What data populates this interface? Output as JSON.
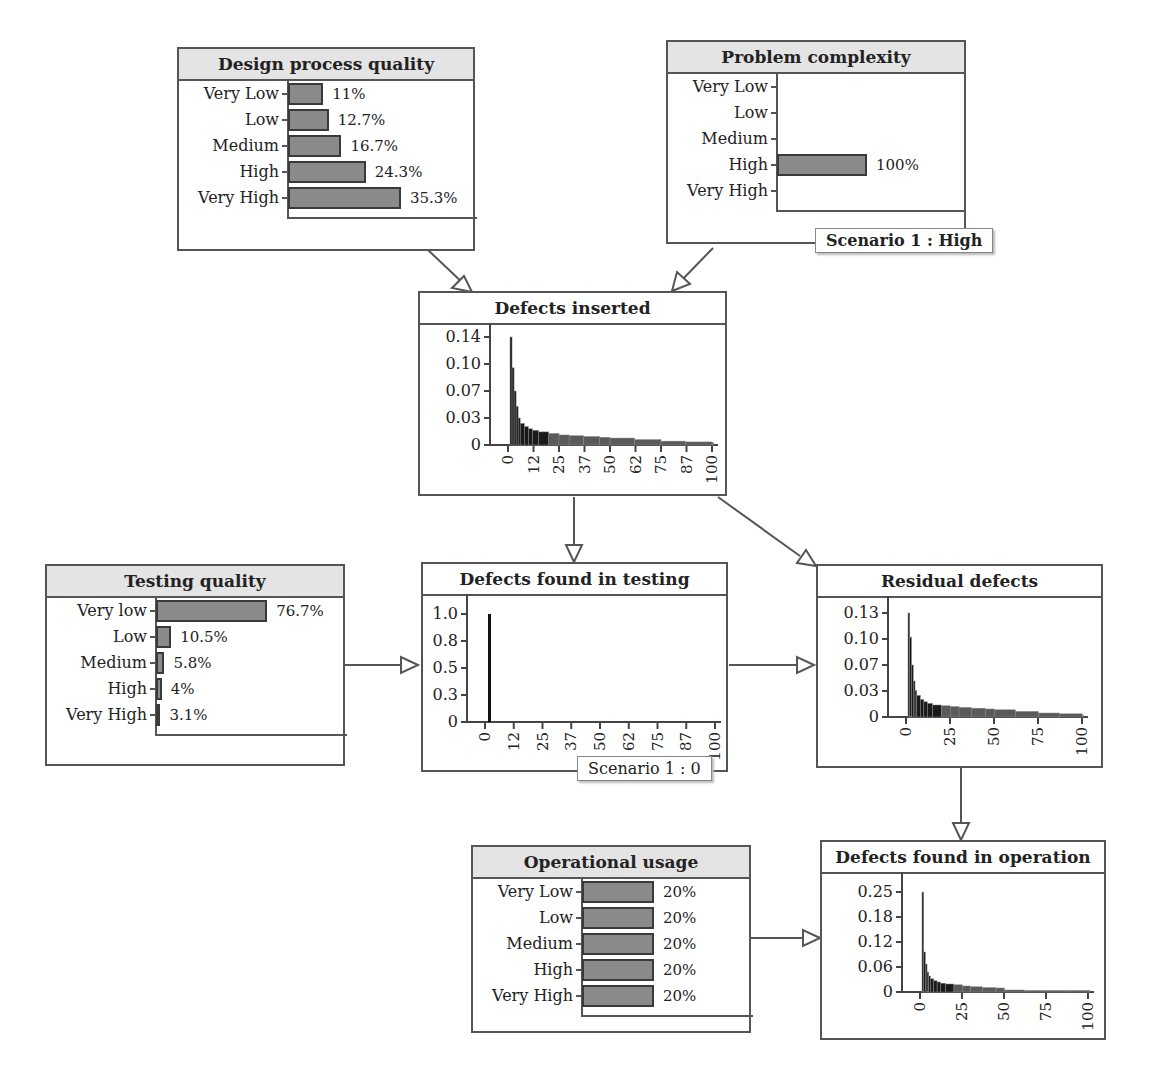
{
  "nodes": {
    "design_process_quality": {
      "title": "Design process quality",
      "states": [
        {
          "label": "Very Low",
          "value": 11,
          "text": "11%"
        },
        {
          "label": "Low",
          "value": 12.7,
          "text": "12.7%"
        },
        {
          "label": "Medium",
          "value": 16.7,
          "text": "16.7%"
        },
        {
          "label": "High",
          "value": 24.3,
          "text": "24.3%"
        },
        {
          "label": "Very High",
          "value": 35.3,
          "text": "35.3%"
        }
      ]
    },
    "problem_complexity": {
      "title": "Problem complexity",
      "states": [
        {
          "label": "Very Low",
          "value": 0,
          "text": ""
        },
        {
          "label": "Low",
          "value": 0,
          "text": ""
        },
        {
          "label": "Medium",
          "value": 0,
          "text": ""
        },
        {
          "label": "High",
          "value": 100,
          "text": "100%"
        },
        {
          "label": "Very High",
          "value": 0,
          "text": ""
        }
      ],
      "scenario": "Scenario 1 : High"
    },
    "defects_inserted": {
      "title": "Defects inserted",
      "yticks": [
        "0.14",
        "0.10",
        "0.07",
        "0.03",
        "0"
      ],
      "xticks": [
        "0",
        "12",
        "25",
        "37",
        "50",
        "62",
        "75",
        "87",
        "100"
      ]
    },
    "testing_quality": {
      "title": "Testing quality",
      "states": [
        {
          "label": "Very low",
          "value": 76.7,
          "text": "76.7%"
        },
        {
          "label": "Low",
          "value": 10.5,
          "text": "10.5%"
        },
        {
          "label": "Medium",
          "value": 5.8,
          "text": "5.8%"
        },
        {
          "label": "High",
          "value": 4,
          "text": "4%"
        },
        {
          "label": "Very High",
          "value": 3.1,
          "text": "3.1%"
        }
      ]
    },
    "defects_found_in_testing": {
      "title": "Defects found in testing",
      "yticks": [
        "1.0",
        "0.8",
        "0.5",
        "0.3",
        "0"
      ],
      "xticks": [
        "0",
        "12",
        "25",
        "37",
        "50",
        "62",
        "75",
        "87",
        "100"
      ],
      "scenario": "Scenario 1 : 0"
    },
    "residual_defects": {
      "title": "Residual defects",
      "yticks": [
        "0.13",
        "0.10",
        "0.07",
        "0.03",
        "0"
      ],
      "xticks": [
        "0",
        "25",
        "50",
        "75",
        "100"
      ]
    },
    "operational_usage": {
      "title": "Operational usage",
      "states": [
        {
          "label": "Very Low",
          "value": 20,
          "text": "20%"
        },
        {
          "label": "Low",
          "value": 20,
          "text": "20%"
        },
        {
          "label": "Medium",
          "value": 20,
          "text": "20%"
        },
        {
          "label": "High",
          "value": 20,
          "text": "20%"
        },
        {
          "label": "Very High",
          "value": 20,
          "text": "20%"
        }
      ]
    },
    "defects_found_in_operation": {
      "title": "Defects found in operation",
      "yticks": [
        "0.25",
        "0.18",
        "0.12",
        "0.06",
        "0"
      ],
      "xticks": [
        "0",
        "25",
        "50",
        "75",
        "100"
      ]
    }
  },
  "chart_data": [
    {
      "type": "bar",
      "title": "Design process quality",
      "categories": [
        "Very Low",
        "Low",
        "Medium",
        "High",
        "Very High"
      ],
      "values": [
        11,
        12.7,
        16.7,
        24.3,
        35.3
      ],
      "unit": "%"
    },
    {
      "type": "bar",
      "title": "Problem complexity",
      "categories": [
        "Very Low",
        "Low",
        "Medium",
        "High",
        "Very High"
      ],
      "values": [
        0,
        0,
        0,
        100,
        0
      ],
      "unit": "%",
      "annotation": "Scenario 1 : High"
    },
    {
      "type": "bar",
      "title": "Defects inserted",
      "xlabel": "",
      "ylabel": "",
      "ylim": [
        0,
        0.14
      ],
      "yticks": [
        0.14,
        0.1,
        0.07,
        0.03,
        0
      ],
      "xticks": [
        0,
        12,
        25,
        37,
        50,
        62,
        75,
        87,
        100
      ],
      "x": [
        1,
        2,
        3,
        4,
        5,
        6,
        8,
        10,
        12,
        15,
        20,
        25,
        30,
        37,
        45,
        50,
        62,
        75,
        87,
        100
      ],
      "values": [
        0.14,
        0.1,
        0.07,
        0.05,
        0.035,
        0.028,
        0.024,
        0.021,
        0.019,
        0.017,
        0.015,
        0.013,
        0.012,
        0.011,
        0.01,
        0.009,
        0.007,
        0.005,
        0.004,
        0.003
      ]
    },
    {
      "type": "bar",
      "title": "Testing quality",
      "categories": [
        "Very low",
        "Low",
        "Medium",
        "High",
        "Very High"
      ],
      "values": [
        76.7,
        10.5,
        5.8,
        4,
        3.1
      ],
      "unit": "%"
    },
    {
      "type": "bar",
      "title": "Defects found in testing",
      "ylim": [
        0,
        1.0
      ],
      "yticks": [
        1.0,
        0.8,
        0.5,
        0.3,
        0
      ],
      "xticks": [
        0,
        12,
        25,
        37,
        50,
        62,
        75,
        87,
        100
      ],
      "x": [
        0
      ],
      "values": [
        1.0
      ],
      "annotation": "Scenario 1 : 0"
    },
    {
      "type": "bar",
      "title": "Residual defects",
      "ylim": [
        0,
        0.13
      ],
      "yticks": [
        0.13,
        0.1,
        0.07,
        0.03,
        0
      ],
      "xticks": [
        0,
        25,
        50,
        75,
        100
      ],
      "x": [
        1,
        2,
        3,
        4,
        5,
        6,
        8,
        10,
        12,
        15,
        20,
        25,
        30,
        37,
        45,
        50,
        62,
        75,
        87,
        100
      ],
      "values": [
        0.13,
        0.1,
        0.065,
        0.045,
        0.033,
        0.027,
        0.022,
        0.019,
        0.017,
        0.015,
        0.014,
        0.013,
        0.012,
        0.011,
        0.01,
        0.009,
        0.007,
        0.005,
        0.004,
        0.002
      ]
    },
    {
      "type": "bar",
      "title": "Operational usage",
      "categories": [
        "Very Low",
        "Low",
        "Medium",
        "High",
        "Very High"
      ],
      "values": [
        20,
        20,
        20,
        20,
        20
      ],
      "unit": "%"
    },
    {
      "type": "bar",
      "title": "Defects found in operation",
      "ylim": [
        0,
        0.25
      ],
      "yticks": [
        0.25,
        0.18,
        0.12,
        0.06,
        0
      ],
      "xticks": [
        0,
        25,
        50,
        75,
        100
      ],
      "x": [
        1,
        2,
        3,
        4,
        5,
        6,
        8,
        10,
        12,
        15,
        20,
        25,
        30,
        37,
        45,
        50,
        62,
        75,
        87,
        100
      ],
      "values": [
        0.25,
        0.1,
        0.07,
        0.05,
        0.04,
        0.033,
        0.028,
        0.025,
        0.022,
        0.02,
        0.018,
        0.015,
        0.013,
        0.011,
        0.01,
        0.005,
        0.004,
        0.004,
        0.004,
        0.004
      ]
    }
  ]
}
